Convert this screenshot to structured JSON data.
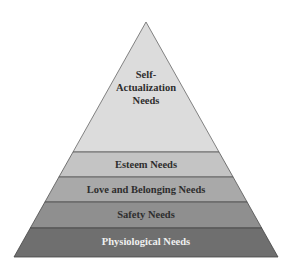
{
  "diagram": {
    "type": "pyramid",
    "levels": [
      {
        "label_lines": [
          "Self-",
          "Actualization",
          "Needs"
        ],
        "label": "Self-Actualization Needs",
        "fill": "#dcdcdc",
        "text_color": "#2e2e2e"
      },
      {
        "label": "Esteem Needs",
        "fill": "#c4c4c4",
        "text_color": "#2e2e2e"
      },
      {
        "label": "Love and Belonging Needs",
        "fill": "#a9a9a9",
        "text_color": "#2e2e2e"
      },
      {
        "label": "Safety Needs",
        "fill": "#8f8f8f",
        "text_color": "#2e2e2e"
      },
      {
        "label": "Physiological Needs",
        "fill": "#6f6f6f",
        "text_color": "#f0f0f0"
      }
    ],
    "outline_color": "#555555"
  }
}
